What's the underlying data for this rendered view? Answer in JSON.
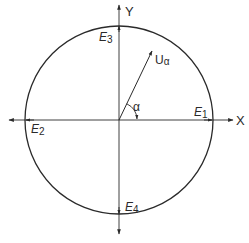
{
  "diagram": {
    "type": "unit-circle-vector",
    "background": "#ffffff",
    "stroke_color": "#2a2a2a",
    "axes": {
      "x_label": "X",
      "y_label": "Y"
    },
    "circle": {
      "center": [
        119,
        120
      ],
      "radius": 94
    },
    "points": [
      {
        "id": "E1",
        "base": "E",
        "sub": "1"
      },
      {
        "id": "E2",
        "base": "E",
        "sub": "2"
      },
      {
        "id": "E3",
        "base": "E",
        "sub": "3"
      },
      {
        "id": "E4",
        "base": "E",
        "sub": "4"
      }
    ],
    "vector": {
      "base": "U",
      "sub": "α"
    },
    "angle": {
      "label": "α"
    }
  }
}
